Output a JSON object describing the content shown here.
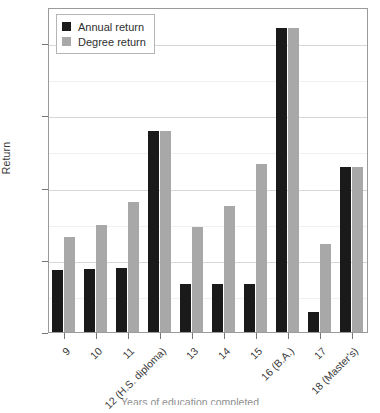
{
  "chart_data": {
    "type": "bar",
    "title": "",
    "xlabel": "Years of education completed",
    "ylabel": "Return",
    "categories": [
      "9",
      "10",
      "11",
      "12 (H.S. diploma)",
      "13",
      "14",
      "15",
      "16 (B.A.)",
      "17",
      "18 (Master's)"
    ],
    "ylim": [
      0,
      45
    ],
    "ytick_labels": [
      "0%",
      "10%",
      "20%",
      "30%",
      "40%"
    ],
    "ytick_values": [
      0,
      10,
      20,
      30,
      40
    ],
    "grid": true,
    "legend_position": "top-left",
    "series": [
      {
        "name": "Annual return",
        "color": "#1a1a1a",
        "values": [
          8.6,
          8.7,
          8.8,
          27.9,
          6.6,
          6.6,
          6.7,
          42.1,
          2.8,
          22.8
        ]
      },
      {
        "name": "Degree return",
        "color": "#a8a8a8",
        "values": [
          13.1,
          14.8,
          18.0,
          27.9,
          14.5,
          17.5,
          23.3,
          42.1,
          12.2,
          22.8
        ]
      }
    ]
  },
  "legend": {
    "items": [
      {
        "label": "Annual return",
        "swatch": "#1a1a1a"
      },
      {
        "label": "Degree return",
        "swatch": "#a8a8a8"
      }
    ]
  },
  "axes": {
    "y_title": "Return",
    "x_title": "Years of education completed"
  }
}
